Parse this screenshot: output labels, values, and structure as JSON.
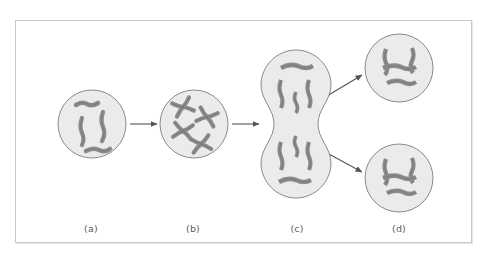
{
  "figure": {
    "background_color": "#ffffff",
    "border_color": "#c9c9c9",
    "cell_fill_color": "#ebebeb",
    "cell_stroke_color": "#8a8a8a",
    "chromosome_fill_color": "#8c8c8c",
    "chromosome_stroke_color": "#5a5a5a",
    "arrow_color": "#555555",
    "label_color": "#5d5d5d"
  },
  "stages": [
    {
      "id": "a",
      "label": "(a)",
      "label_x": 91,
      "label_y": 230,
      "shape": "circle",
      "center_x": 92,
      "center_y": 124,
      "radius": 34,
      "chromosome_count": 4,
      "chromosome_type": "unreplicated",
      "description": "Single cell with four unreplicated rod-shaped chromosomes"
    },
    {
      "id": "b",
      "label": "(b)",
      "label_x": 193,
      "label_y": 230,
      "shape": "circle",
      "center_x": 194,
      "center_y": 124,
      "radius": 34,
      "chromosome_count": 4,
      "chromosome_type": "replicated",
      "description": "Single cell with four replicated X-shaped chromosomes with sister chromatids"
    },
    {
      "id": "c",
      "label": "(c)",
      "label_x": 297,
      "label_y": 230,
      "shape": "dumbbell",
      "center_x": 296,
      "center_y": 124,
      "radius": 35,
      "upper_lobe_y": 85,
      "lower_lobe_y": 163,
      "waist_y": 124,
      "chromosome_count": 8,
      "chromosomes_per_pole": 4,
      "chromosome_type": "unreplicated",
      "description": "Elongated dividing cell pinching at the middle, four chromosomes at each pole"
    },
    {
      "id": "d",
      "label": "(d)",
      "label_x": 399,
      "label_y": 230,
      "shape": "two-circles",
      "center_x": 399,
      "upper_center_y": 68,
      "lower_center_y": 178,
      "radius": 34,
      "cell_count": 2,
      "chromosome_count_each": 4,
      "chromosome_type": "unreplicated",
      "description": "Two separate daughter cells each containing four chromosomes"
    }
  ],
  "arrows": [
    {
      "id": "a-to-b",
      "x1": 130,
      "y1": 124,
      "x2": 159,
      "y2": 124,
      "direction": "right"
    },
    {
      "id": "b-to-c",
      "x1": 232,
      "y1": 124,
      "x2": 261,
      "y2": 124,
      "direction": "right"
    },
    {
      "id": "c-to-d-upper",
      "x1": 327,
      "y1": 95,
      "x2": 364,
      "y2": 74,
      "direction": "up-right"
    },
    {
      "id": "c-to-d-lower",
      "x1": 327,
      "y1": 154,
      "x2": 364,
      "y2": 173,
      "direction": "down-right"
    }
  ]
}
